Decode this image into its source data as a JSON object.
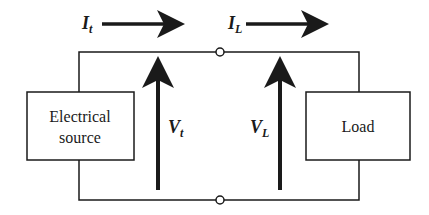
{
  "diagram": {
    "type": "circuit-block-diagram",
    "colors": {
      "ink": "#1a1a1a",
      "background": "#ffffff"
    },
    "source_box": {
      "line1": "Electrical",
      "line2": "source"
    },
    "load_box": {
      "label": "Load"
    },
    "currents": [
      {
        "symbol": "I",
        "subscript": "t",
        "direction": "right"
      },
      {
        "symbol": "I",
        "subscript": "L",
        "direction": "right"
      }
    ],
    "voltages": [
      {
        "symbol": "V",
        "subscript": "t",
        "direction": "up"
      },
      {
        "symbol": "V",
        "subscript": "L",
        "direction": "up"
      }
    ],
    "terminals": [
      {
        "position": "top",
        "shape": "open-circle"
      },
      {
        "position": "bottom",
        "shape": "open-circle"
      }
    ]
  }
}
